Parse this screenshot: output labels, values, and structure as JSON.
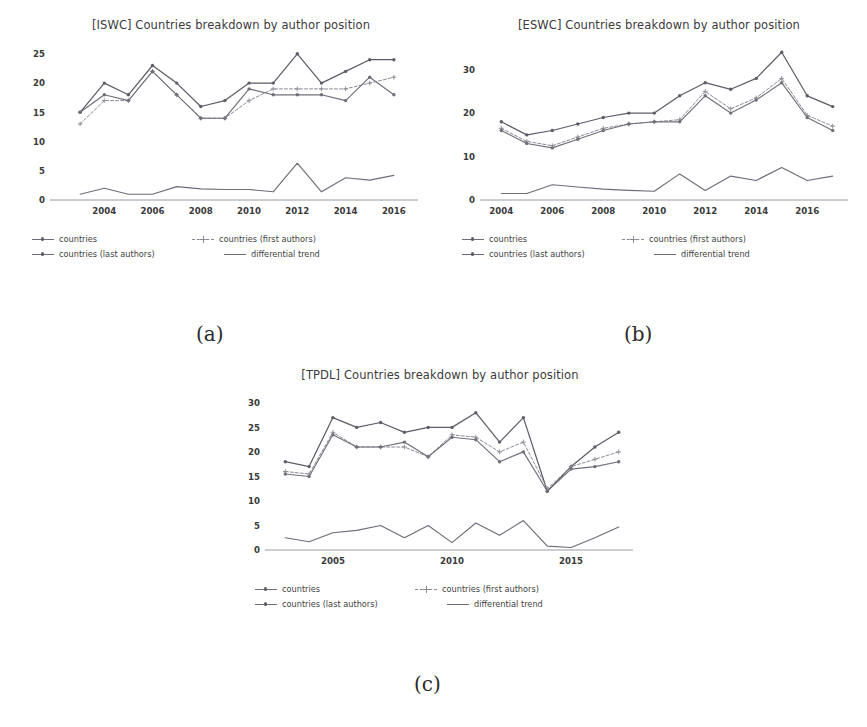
{
  "page": {
    "background": "#ffffff",
    "captions": [
      {
        "id": "a",
        "text": "(a)"
      },
      {
        "id": "b",
        "text": "(b)"
      },
      {
        "id": "c",
        "text": "(c)"
      }
    ]
  },
  "legend_labels": {
    "countries": "countries",
    "countries_first": "countries (first authors)",
    "countries_last": "countries (last authors)",
    "differential": "differential trend"
  },
  "colors": {
    "countries": "#5d5d68",
    "countries_first": "#8a8a94",
    "countries_last": "#6f6f7a",
    "differential": "#6d6d78",
    "axis": "#9a9aa2",
    "text": "#3b3b3b"
  },
  "chart_data": [
    {
      "id": "iswc",
      "type": "line",
      "title": "[ISWC] Countries breakdown by author position",
      "xlabel": "",
      "ylabel": "",
      "grid": false,
      "legend_position": "below",
      "xlim": [
        2002,
        2017
      ],
      "ylim": [
        0,
        26
      ],
      "yticks": [
        0,
        5,
        10,
        15,
        20,
        25
      ],
      "xticks": [
        2004,
        2006,
        2008,
        2010,
        2012,
        2014,
        2016
      ],
      "x": [
        2003,
        2004,
        2005,
        2006,
        2007,
        2008,
        2009,
        2010,
        2011,
        2012,
        2013,
        2014,
        2015,
        2016,
        2017
      ],
      "series": [
        {
          "name": "countries",
          "values": [
            15,
            20,
            18,
            23,
            20,
            16,
            17,
            20,
            20,
            25,
            20,
            22,
            24,
            24,
            null
          ]
        },
        {
          "name": "countries (first authors)",
          "values": [
            13,
            17,
            17,
            22,
            18,
            14,
            14,
            17,
            19,
            19,
            19,
            19,
            20,
            21,
            null
          ]
        },
        {
          "name": "countries (last authors)",
          "values": [
            15,
            18,
            17,
            22,
            18,
            14,
            14,
            19,
            18,
            18,
            18,
            17,
            21,
            18,
            null
          ]
        },
        {
          "name": "differential trend",
          "values": [
            1,
            2,
            1,
            1,
            2.3,
            1.9,
            1.8,
            1.8,
            1.4,
            6.3,
            1.4,
            3.8,
            3.4,
            4.2,
            null
          ]
        }
      ]
    },
    {
      "id": "eswc",
      "type": "line",
      "title": "[ESWC] Countries breakdown by author position",
      "xlabel": "",
      "ylabel": "",
      "grid": false,
      "legend_position": "below",
      "xlim": [
        2003.4,
        2017.6
      ],
      "ylim": [
        0,
        35
      ],
      "yticks": [
        0,
        10,
        20,
        30
      ],
      "xticks": [
        2004,
        2006,
        2008,
        2010,
        2012,
        2014,
        2016
      ],
      "x": [
        2004,
        2005,
        2006,
        2007,
        2008,
        2009,
        2010,
        2011,
        2012,
        2013,
        2014,
        2015,
        2016,
        2017
      ],
      "series": [
        {
          "name": "countries",
          "values": [
            18,
            15,
            16,
            17.5,
            19,
            20,
            20,
            24,
            27,
            25.5,
            28,
            34,
            24,
            21.5
          ]
        },
        {
          "name": "countries (first authors)",
          "values": [
            16.5,
            13.5,
            12.5,
            14.5,
            16.5,
            17.5,
            18,
            18.5,
            25,
            21,
            23.5,
            28,
            19.5,
            17
          ]
        },
        {
          "name": "countries (last authors)",
          "values": [
            16,
            13,
            12,
            14,
            16,
            17.5,
            18,
            18,
            24,
            20,
            23,
            27,
            19,
            16
          ]
        },
        {
          "name": "differential trend",
          "values": [
            1.5,
            1.5,
            3.5,
            3,
            2.5,
            2.2,
            2,
            6,
            2.2,
            5.5,
            4.5,
            7.5,
            4.5,
            5.5
          ]
        }
      ]
    },
    {
      "id": "tpdl",
      "type": "line",
      "title": "[TPDL] Countries breakdown by author position",
      "xlabel": "",
      "ylabel": "",
      "grid": false,
      "legend_position": "below",
      "xlim": [
        2002.4,
        2017.6
      ],
      "ylim": [
        0,
        31
      ],
      "yticks": [
        0,
        5,
        10,
        15,
        20,
        25,
        30
      ],
      "xticks": [
        2005,
        2010,
        2015
      ],
      "x": [
        2003,
        2004,
        2005,
        2006,
        2007,
        2008,
        2009,
        2010,
        2011,
        2012,
        2013,
        2014,
        2015,
        2016,
        2017
      ],
      "series": [
        {
          "name": "countries",
          "values": [
            18,
            17,
            27,
            25,
            26,
            24,
            25,
            25,
            28,
            22,
            27,
            12,
            17,
            21,
            24
          ]
        },
        {
          "name": "countries (first authors)",
          "values": [
            16,
            15.5,
            24,
            21,
            21,
            21,
            19,
            23.5,
            23,
            20,
            22,
            12.5,
            17,
            18.5,
            20
          ]
        },
        {
          "name": "countries (last authors)",
          "values": [
            15.5,
            15,
            23.5,
            21,
            21,
            22,
            19,
            23,
            22.5,
            18,
            20,
            12,
            16.5,
            17,
            18
          ]
        },
        {
          "name": "differential trend",
          "values": [
            2.5,
            1.7,
            3.5,
            4,
            5,
            2.5,
            5,
            1.5,
            5.5,
            3,
            6,
            0.8,
            0.5,
            2.5,
            4.7
          ]
        }
      ]
    }
  ]
}
